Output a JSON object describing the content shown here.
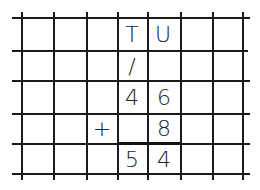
{
  "worksheet": {
    "headers": {
      "tens": "T",
      "units": "U"
    },
    "carry": {
      "tens": "/"
    },
    "addend1": {
      "tens": "4",
      "units": "6"
    },
    "operator": "+",
    "addend2": {
      "units": "8"
    },
    "result": {
      "tens": "5",
      "units": "4"
    }
  }
}
